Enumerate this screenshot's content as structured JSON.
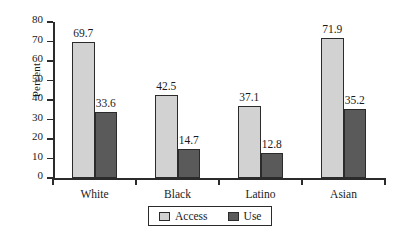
{
  "chart_data": {
    "type": "bar",
    "title": "",
    "xlabel": "",
    "ylabel": "Percent",
    "categories": [
      "White",
      "Black",
      "Latino",
      "Asian"
    ],
    "series": [
      {
        "name": "Access",
        "color": "#d2d2d2",
        "values": [
          69.7,
          42.5,
          37.1,
          71.9
        ]
      },
      {
        "name": "Use",
        "color": "#5a5a5a",
        "values": [
          33.6,
          14.7,
          12.8,
          35.2
        ]
      }
    ],
    "ylim": [
      0,
      80
    ],
    "yticks": [
      0,
      10,
      20,
      30,
      40,
      50,
      60,
      70,
      80
    ],
    "ytick_labels": [
      "0",
      "10",
      "20",
      "30",
      "40",
      "50",
      "60",
      "70",
      "80"
    ],
    "value_labels": [
      [
        "69.7",
        "33.6"
      ],
      [
        "42.5",
        "14.7"
      ],
      [
        "37.1",
        "12.8"
      ],
      [
        "71.9",
        "35.2"
      ]
    ],
    "grid": false,
    "legend_position": "bottom-center",
    "legend_entries": [
      "Access",
      "Use"
    ],
    "axis_color": "#2b2b2b",
    "background": "#ffffff"
  }
}
